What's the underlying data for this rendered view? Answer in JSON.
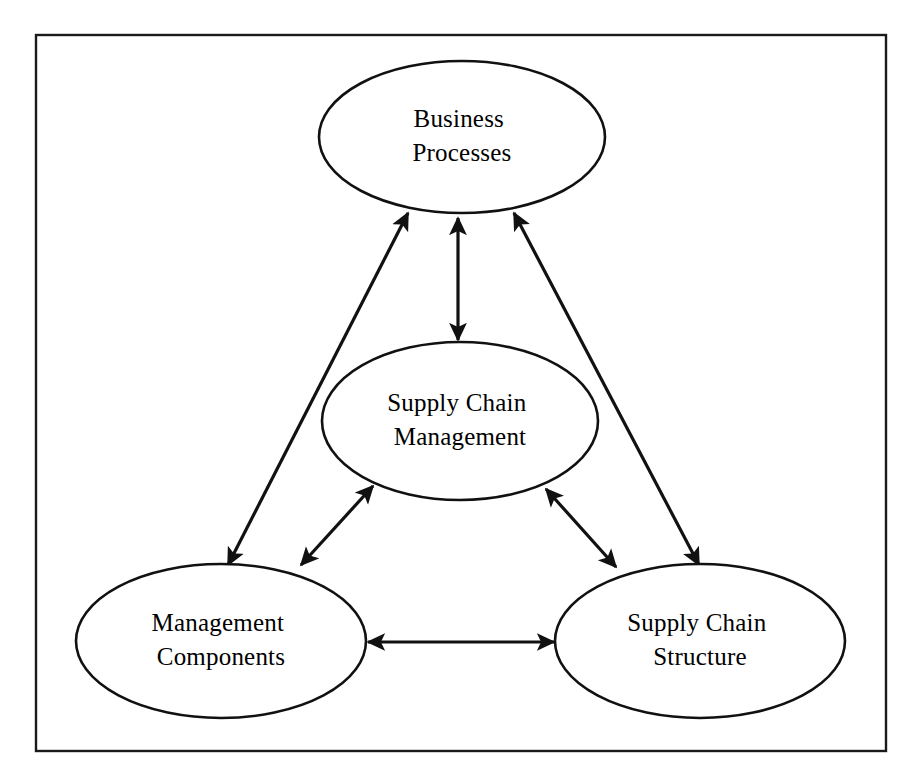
{
  "figure": {
    "background_color": "#ffffff",
    "border_color": "#1a1a1a",
    "node_fill": "#ffffff",
    "node_stroke": "#111111",
    "arrow_color": "#111111"
  },
  "nodes": [
    {
      "id": "business-processes",
      "line1": "Business",
      "line2": "Processes",
      "cx": 462,
      "cy": 137,
      "rx": 143,
      "ry": 76
    },
    {
      "id": "supply-chain-management",
      "line1": "Supply Chain",
      "line2": "Management",
      "cx": 460,
      "cy": 421,
      "rx": 138,
      "ry": 79
    },
    {
      "id": "management-components",
      "line1": "Management",
      "line2": "Components",
      "cx": 221,
      "cy": 641,
      "rx": 145,
      "ry": 77
    },
    {
      "id": "supply-chain-structure",
      "line1": "Supply Chain",
      "line2": "Structure",
      "cx": 700,
      "cy": 641,
      "rx": 145,
      "ry": 77
    }
  ],
  "connectors": [
    {
      "id": "bp-scm",
      "from": "business-processes",
      "to": "supply-chain-management",
      "style": "double-headed",
      "x1": 458,
      "y1": 216,
      "x2": 458,
      "y2": 341
    },
    {
      "id": "scm-mc",
      "from": "supply-chain-management",
      "to": "management-components",
      "style": "double-headed",
      "x1": 374,
      "y1": 487,
      "x2": 300,
      "y2": 566
    },
    {
      "id": "scm-scs",
      "from": "supply-chain-management",
      "to": "supply-chain-structure",
      "style": "double-headed",
      "x1": 545,
      "y1": 489,
      "x2": 617,
      "y2": 568
    },
    {
      "id": "bp-mc",
      "from": "business-processes",
      "to": "management-components",
      "style": "double-headed",
      "x1": 406,
      "y1": 212,
      "x2": 227,
      "y2": 566
    },
    {
      "id": "bp-scs",
      "from": "business-processes",
      "to": "supply-chain-structure",
      "style": "double-headed",
      "x1": 516,
      "y1": 212,
      "x2": 700,
      "y2": 566
    },
    {
      "id": "mc-scs",
      "from": "management-components",
      "to": "supply-chain-structure",
      "style": "double-headed",
      "x1": 366,
      "y1": 642,
      "x2": 556,
      "y2": 642
    }
  ],
  "frame": {
    "x": 36,
    "y": 35,
    "width": 850,
    "height": 716
  }
}
